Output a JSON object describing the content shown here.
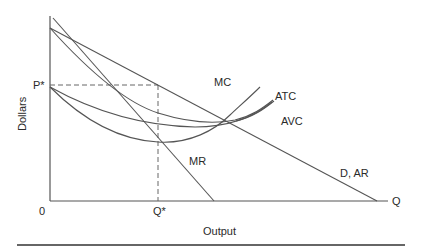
{
  "diagram": {
    "type": "monopoly-cost-revenue",
    "y_axis_label": "Dollars",
    "x_axis_label": "Output",
    "origin_label": "0",
    "x_axis_end_label": "Q",
    "price_label": "P*",
    "quantity_label": "Q*",
    "curves": {
      "mc": "MC",
      "atc": "ATC",
      "avc": "AVC",
      "mr": "MR",
      "demand": "D, AR"
    }
  },
  "colors": {
    "line": "#555555",
    "text": "#2a2a2a",
    "background": "#ffffff"
  }
}
